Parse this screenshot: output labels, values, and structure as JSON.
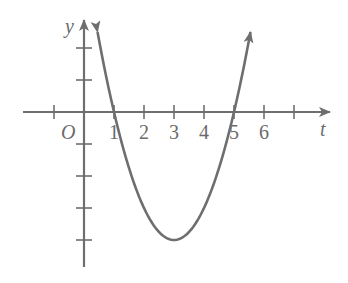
{
  "chart_data": {
    "type": "line",
    "title": "",
    "xlabel": "t",
    "ylabel": "y",
    "origin_label": "O",
    "x_tick_labels": [
      "1",
      "2",
      "3",
      "4",
      "5",
      "6"
    ],
    "x_ticks": [
      -1,
      1,
      2,
      3,
      4,
      5,
      6,
      7
    ],
    "y_ticks": [
      2,
      1,
      -1,
      -2,
      -3,
      -4
    ],
    "xlim": [
      -2,
      8
    ],
    "ylim": [
      -5,
      3
    ],
    "grid": false,
    "legend": null,
    "series": [
      {
        "name": "parabola",
        "function": "y = (t - 1)(t - 5)",
        "roots": [
          1,
          5
        ],
        "vertex": [
          3,
          -4
        ],
        "x": [
          0.45,
          1,
          2,
          3,
          4,
          5,
          5.55
        ],
        "values": [
          2.6,
          0,
          -3,
          -4,
          -3,
          0,
          2.6
        ],
        "color": "#6e6e6e",
        "arrows_at_ends": true
      }
    ]
  },
  "colors": {
    "stroke": "#6e6e6e",
    "background": "#ffffff"
  }
}
